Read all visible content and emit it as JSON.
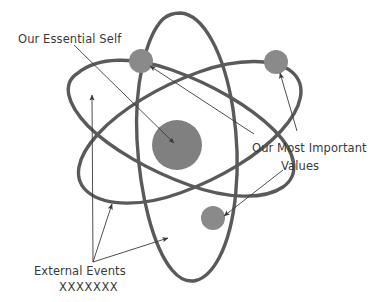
{
  "diagram": {
    "background_color": "#ffffff",
    "orbit_stroke_color": "#5a5a5a",
    "nucleus_color": "#808080",
    "electron_color": "#8a8a8a",
    "arrow_color": "#3a3a3a",
    "text_color": "#3a3a3a",
    "labels": {
      "essential_self": "Our Essential Self",
      "most_important_values_line1": "Our Most Important",
      "most_important_values_line2": "Values",
      "external_events_line1": "External Events",
      "external_events_line2": "XXXXXXX"
    },
    "parts": {
      "nucleus_name": "nucleus",
      "electron_top_name": "electron-top",
      "electron_right_name": "electron-right",
      "electron_lower_name": "electron-lower",
      "orbit_vertical_name": "orbit-vertical",
      "orbit_left_tilt_name": "orbit-left-tilt",
      "orbit_right_tilt_name": "orbit-right-tilt"
    }
  }
}
